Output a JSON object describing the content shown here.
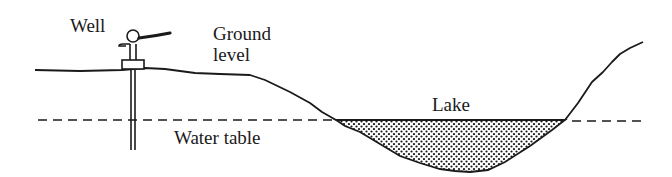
{
  "diagram": {
    "type": "cross-section",
    "labels": {
      "well": "Well",
      "ground_level_line1": "Ground",
      "ground_level_line2": "level",
      "lake": "Lake",
      "water_table": "Water table"
    },
    "colors": {
      "stroke": "#1a1a1a",
      "background": "#ffffff",
      "lake_fill_dots": "#1a1a1a"
    }
  }
}
